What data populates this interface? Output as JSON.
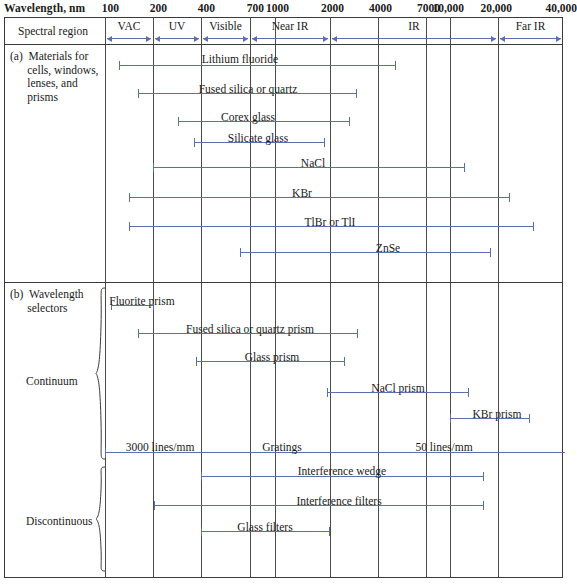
{
  "axis": {
    "title": "Wavelength, nm",
    "ticks": [
      {
        "label": "100",
        "value": 100,
        "x": 105
      },
      {
        "label": "200",
        "value": 200,
        "x": 153
      },
      {
        "label": "400",
        "value": 400,
        "x": 201
      },
      {
        "label": "700",
        "value": 700,
        "x": 250
      },
      {
        "label": "1000",
        "value": 1000,
        "x": 275
      },
      {
        "label": "2000",
        "value": 2000,
        "x": 330
      },
      {
        "label": "4000",
        "value": 4000,
        "x": 378
      },
      {
        "label": "7000",
        "value": 7000,
        "x": 426
      },
      {
        "label": "10,000",
        "value": 10000,
        "x": 450
      },
      {
        "label": "20,000",
        "value": 20000,
        "x": 498
      },
      {
        "label": "40,000",
        "value": 40000,
        "x": 563
      }
    ]
  },
  "spectral_region": {
    "row_label": "Spectral region",
    "regions": [
      {
        "name": "VAC",
        "x1": 105,
        "x2": 153
      },
      {
        "name": "UV",
        "x1": 153,
        "x2": 201
      },
      {
        "name": "Visible",
        "x1": 201,
        "x2": 250
      },
      {
        "name": "Near IR",
        "x1": 250,
        "x2": 330
      },
      {
        "name": "IR",
        "x1": 330,
        "x2": 498
      },
      {
        "name": "Far IR",
        "x1": 498,
        "x2": 563
      }
    ]
  },
  "sections": [
    {
      "id": "a",
      "heading": "(a)  Materials for\n      cells, windows,\n      lenses, and\n      prisms",
      "bars": [
        {
          "label": "Lithium fluoride",
          "x1": 119,
          "x2": 396,
          "y": 65,
          "label_x": 240,
          "label_y": 53
        },
        {
          "label": "Fused silica or quartz",
          "x1": 138,
          "x2": 357,
          "y": 93,
          "label_x": 248,
          "label_y": 83
        },
        {
          "label": "Corex glass",
          "x1": 178,
          "x2": 350,
          "y": 121,
          "label_x": 248,
          "label_y": 111
        },
        {
          "label": "Silicate glass",
          "x1": 194,
          "x2": 325,
          "y": 142,
          "label_x": 258,
          "label_y": 132
        },
        {
          "label": "NaCl",
          "x1": 153,
          "x2": 465,
          "y": 167,
          "label_x": 313,
          "label_y": 157
        },
        {
          "label": "KBr",
          "x1": 129,
          "x2": 510,
          "y": 197,
          "label_x": 302,
          "label_y": 187
        },
        {
          "label": "TlBr or TlI",
          "x1": 129,
          "x2": 534,
          "y": 226,
          "label_x": 330,
          "label_y": 216
        },
        {
          "label": "ZnSe",
          "x1": 240,
          "x2": 491,
          "y": 252,
          "label_x": 388,
          "label_y": 242
        }
      ]
    },
    {
      "id": "b",
      "heading": "(b)  Wavelength\n      selectors",
      "groups": [
        {
          "label": "Continuum",
          "y": 381,
          "brace_top": 287,
          "brace_bottom": 460
        },
        {
          "label": "Discontinuous",
          "y": 521,
          "brace_top": 466,
          "brace_bottom": 572
        }
      ],
      "bars": [
        {
          "label": "Fluorite prism",
          "x1": 111,
          "x2": 154,
          "y": 305,
          "label_x": 142,
          "label_y": 295
        },
        {
          "label": "Fused silica or quartz prism",
          "x1": 138,
          "x2": 358,
          "y": 333,
          "label_x": 250,
          "label_y": 323
        },
        {
          "label": "Glass prism",
          "x1": 196,
          "x2": 345,
          "y": 361,
          "label_x": 272,
          "label_y": 351
        },
        {
          "label": "NaCl prism",
          "x1": 327,
          "x2": 469,
          "y": 392,
          "label_x": 398,
          "label_y": 382
        },
        {
          "label": "KBr prism",
          "x1": 450,
          "x2": 530,
          "y": 418,
          "label_x": 497,
          "label_y": 408
        },
        {
          "label": "3000 lines/mm",
          "x1": 105,
          "x2": 565,
          "y": 452,
          "label_x": 160,
          "label_y": 441
        },
        {
          "label": "Gratings",
          "x1": null,
          "x2": null,
          "y": null,
          "label_x": 282,
          "label_y": 441
        },
        {
          "label": "50 lines/mm",
          "x1": null,
          "x2": null,
          "y": null,
          "label_x": 444,
          "label_y": 441
        },
        {
          "label": "Interference wedge",
          "x1": 201,
          "x2": 484,
          "y": 476,
          "label_x": 342,
          "label_y": 465
        },
        {
          "label": "Interference filters",
          "x1": 154,
          "x2": 484,
          "y": 505,
          "label_x": 339,
          "label_y": 495
        },
        {
          "label": "Glass filters",
          "x1": 201,
          "x2": 330,
          "y": 531,
          "label_x": 265,
          "label_y": 521
        }
      ]
    }
  ],
  "colors": {
    "bar": "#5a6fb0",
    "grid": "#4a4a4a",
    "frame": "#3a3a3a",
    "text": "#1a1a1a",
    "background": "#ffffff"
  },
  "layout": {
    "frame_left": 4,
    "frame_right": 563,
    "frame_top": 17,
    "frame_bottom": 578,
    "band_bottom": 44,
    "section_divider_y": 282,
    "grid_left": 105
  }
}
